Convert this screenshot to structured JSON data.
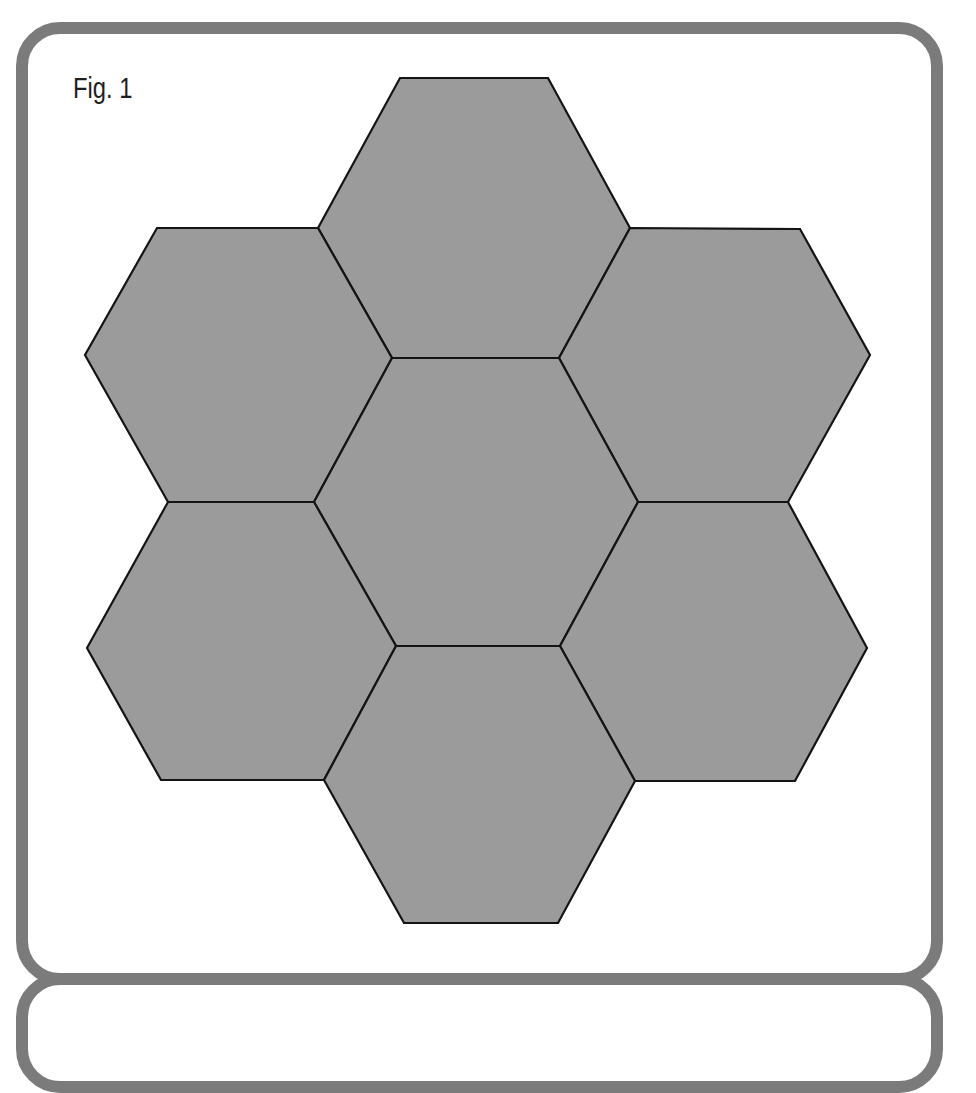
{
  "figure": {
    "label": "Fig. 1",
    "border_color": "#7b7b7b",
    "hex_fill": "#9b9b9b",
    "hex_stroke": "#141414",
    "hexagons": [
      {
        "name": "top",
        "points": "400,78 548,78 630,228 559,358 392,358 318,228"
      },
      {
        "name": "upper-left",
        "points": "157,228 318,228 392,358 314,502 168,502 85,355"
      },
      {
        "name": "upper-right",
        "points": "630,228 800,229 870,355 788,502 638,502 559,358"
      },
      {
        "name": "center",
        "points": "392,358 559,358 638,502 560,646 396,646 314,502"
      },
      {
        "name": "lower-left",
        "points": "168,502 314,502 396,646 324,780 161,780 87,648"
      },
      {
        "name": "lower-right",
        "points": "638,502 788,502 867,648 795,781 635,781 560,646"
      },
      {
        "name": "bottom",
        "points": "396,646 560,646 635,781 558,923 404,923 324,780"
      }
    ]
  }
}
